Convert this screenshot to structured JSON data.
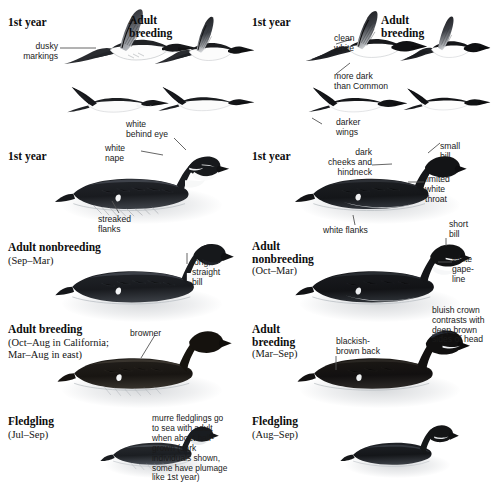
{
  "plate": {
    "kind": "bird-field-guide-plate",
    "columns": [
      {
        "id": "left",
        "species_implied": "Common Murre",
        "groups": [
          {
            "title": "1st year",
            "subtitle": ""
          },
          {
            "title": "Adult\nbreeding",
            "subtitle": ""
          },
          {
            "title": "1st year",
            "subtitle": ""
          },
          {
            "title": "Adult nonbreeding",
            "subtitle": "(Sep–Mar)"
          },
          {
            "title": "Adult breeding",
            "subtitle": "(Oct–Aug in California;\nMar–Aug in east)"
          },
          {
            "title": "Fledgling",
            "subtitle": "(Jul–Sep)"
          }
        ],
        "callouts": [
          "dusky\nmarkings",
          "white\nbehind eye",
          "white\nnape",
          "streaked\nflanks",
          "long,\nstraight\nbill",
          "browner"
        ],
        "notes": [
          "murre fledglings go\nto sea with adult\nwhen about half-\ngrown (dark\nindividuals shown,\nsome have plumage\nlike 1st year)"
        ]
      },
      {
        "id": "right",
        "species_implied": "Thick-billed Murre",
        "groups": [
          {
            "title": "1st year",
            "subtitle": ""
          },
          {
            "title": "Adult\nbreeding",
            "subtitle": ""
          },
          {
            "title": "1st year",
            "subtitle": ""
          },
          {
            "title": "Adult\nnonbreeding",
            "subtitle": "(Oct–Mar)"
          },
          {
            "title": "Adult\nbreeding",
            "subtitle": "(Mar–Sep)"
          },
          {
            "title": "Fledgling",
            "subtitle": "(Aug–Sep)"
          }
        ],
        "callouts": [
          "clean\nwhite",
          "more dark\nthan Common",
          "darker\nwings",
          "dark\ncheeks and\nhindneck",
          "small\nbill",
          "limited\nwhite\nthroat",
          "white flanks",
          "short\nbill",
          "white\ngape-\nline",
          "bluish crown\ncontrasts with\ndeep brown\nsides of head",
          "blackish-\nbrown back"
        ],
        "notes": []
      }
    ]
  },
  "labels": {
    "l_1st_year_flight": "1st year",
    "l_adult_breeding_flight": "Adult\nbreeding",
    "l_dusky_markings": "dusky\nmarkings",
    "l_white_behind_eye": "white\nbehind eye",
    "l_white_nape": "white\nnape",
    "l_1st_year_swim": "1st year",
    "l_streaked_flanks": "streaked\nflanks",
    "l_adult_nonbreeding": "Adult nonbreeding",
    "l_adult_nonbreeding_dates": "(Sep–Mar)",
    "l_long_straight_bill": "long,\nstraight\nbill",
    "l_adult_breeding": "Adult breeding",
    "l_adult_breeding_dates": "(Oct–Aug in California;\nMar–Aug in east)",
    "l_browner": "browner",
    "l_fledgling": "Fledgling",
    "l_fledgling_dates": "(Jul–Sep)",
    "l_fledgling_note": "murre fledglings go\nto sea with adult\nwhen about half-\ngrown (dark\nindividuals shown,\nsome have plumage\nlike 1st year)",
    "r_1st_year_flight": "1st year",
    "r_adult_breeding_flight": "Adult\nbreeding",
    "r_clean_white": "clean\nwhite",
    "r_more_dark": "more dark\nthan Common",
    "r_darker_wings": "darker\nwings",
    "r_1st_year_swim": "1st year",
    "r_dark_cheeks": "dark\ncheeks and\nhindneck",
    "r_small_bill": "small\nbill",
    "r_limited_white_throat": "limited\nwhite\nthroat",
    "r_white_flanks": "white flanks",
    "r_short_bill": "short\nbill",
    "r_adult_nonbreeding": "Adult\nnonbreeding",
    "r_adult_nonbreeding_dates": "(Oct–Mar)",
    "r_white_gape_line": "white\ngape-\nline",
    "r_bluish_crown": "bluish crown\ncontrasts with\ndeep brown\nsides of head",
    "r_adult_breeding": "Adult\nbreeding",
    "r_adult_breeding_dates": "(Mar–Sep)",
    "r_blackish_brown_back": "blackish-\nbrown back",
    "r_fledgling": "Fledgling",
    "r_fledgling_dates": "(Aug–Sep)"
  },
  "colors": {
    "background": "#ffffff",
    "ink_dark": "#1a1a1a",
    "plumage_black": "#121212",
    "plumage_dark_brown": "#2a241f",
    "plumage_mid_gray": "#5d6067",
    "plumage_white": "#fbfbfb",
    "water_wash": "#8e949b",
    "leader_line": "#555555"
  }
}
